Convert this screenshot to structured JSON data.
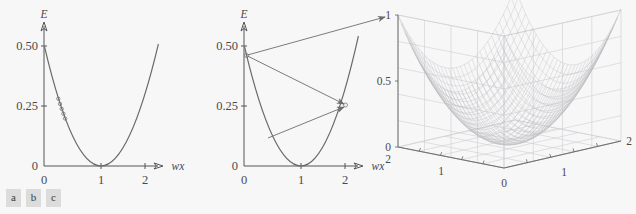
{
  "figure": {
    "background_color": "#f7f7f8",
    "curve_color": "#6a6a6a",
    "mesh_color": "#b9b9bd",
    "grid_color": "#cfcfd2",
    "axis_color": "#555555"
  },
  "caption": {
    "tags": [
      "a",
      "b",
      "c"
    ]
  },
  "panel_a": {
    "name": "error-curve-with-samples",
    "y_axis_label": "E",
    "x_axis_label": "wx",
    "y_ticks": [
      "0.50",
      "0.25",
      "0"
    ],
    "x_ticks": [
      "0",
      "1",
      "2"
    ]
  },
  "panel_b": {
    "name": "error-curve-with-gradient-arrows",
    "y_axis_label": "E",
    "x_axis_label": "wx",
    "y_ticks": [
      "0.50",
      "0.25",
      "0"
    ],
    "x_ticks": [
      "0",
      "1",
      "2"
    ]
  },
  "panel_c": {
    "name": "error-surface-3d",
    "z_ticks": [
      "1",
      "0.5",
      "0"
    ],
    "x_ticks": [
      "0",
      "1",
      "2"
    ],
    "y_ticks": [
      "2",
      "1",
      "0"
    ]
  },
  "chart_data": [
    {
      "type": "line",
      "title": "",
      "panel": "a",
      "xlabel": "wx",
      "ylabel": "E",
      "xlim": [
        -0.12,
        2.25
      ],
      "ylim": [
        0,
        0.56
      ],
      "xticks": [
        0,
        1,
        2
      ],
      "xticklabels": [
        "0",
        "1",
        "2"
      ],
      "yticks": [
        0,
        0.25,
        0.5
      ],
      "yticklabels": [
        "0",
        "0.25",
        "0.50"
      ],
      "grid": false,
      "legend": "none",
      "series": [
        {
          "name": "E = 0.5 (wx - 1)^2",
          "type": "line",
          "x": [
            0.0,
            0.1,
            0.2,
            0.3,
            0.4,
            0.5,
            0.6,
            0.7,
            0.8,
            0.9,
            1.0,
            1.1,
            1.2,
            1.3,
            1.4,
            1.5,
            1.6,
            1.7,
            1.8,
            1.9,
            2.0,
            2.1,
            2.2
          ],
          "y": [
            0.5,
            0.405,
            0.32,
            0.245,
            0.18,
            0.125,
            0.08,
            0.045,
            0.02,
            0.005,
            0.0,
            0.005,
            0.02,
            0.045,
            0.08,
            0.125,
            0.18,
            0.245,
            0.32,
            0.405,
            0.5,
            0.605,
            0.72
          ]
        },
        {
          "name": "sample markers",
          "type": "scatter",
          "x": [
            0.25,
            0.28,
            0.31,
            0.34,
            0.37
          ],
          "y": [
            0.281,
            0.259,
            0.238,
            0.218,
            0.198
          ]
        }
      ]
    },
    {
      "type": "line",
      "title": "",
      "panel": "b",
      "xlabel": "wx",
      "ylabel": "E",
      "xlim": [
        -0.12,
        2.25
      ],
      "ylim": [
        0,
        0.56
      ],
      "xticks": [
        0,
        1,
        2
      ],
      "xticklabels": [
        "0",
        "1",
        "2"
      ],
      "yticks": [
        0,
        0.25,
        0.5
      ],
      "yticklabels": [
        "0",
        "0.25",
        "0.50"
      ],
      "grid": false,
      "legend": "none",
      "series": [
        {
          "name": "E = 0.5 (wx - 1)^2",
          "type": "line",
          "x": [
            0.0,
            0.1,
            0.2,
            0.3,
            0.4,
            0.5,
            0.6,
            0.7,
            0.8,
            0.9,
            1.0,
            1.1,
            1.2,
            1.3,
            1.4,
            1.5,
            1.6,
            1.7,
            1.8,
            1.9,
            2.0,
            2.1,
            2.2
          ],
          "y": [
            0.5,
            0.405,
            0.32,
            0.245,
            0.18,
            0.125,
            0.08,
            0.045,
            0.02,
            0.005,
            0.0,
            0.005,
            0.02,
            0.045,
            0.08,
            0.125,
            0.18,
            0.245,
            0.32,
            0.405,
            0.5,
            0.605,
            0.72
          ]
        }
      ],
      "annotations": [
        {
          "kind": "arrow",
          "label": "tangent-arrow-up-right",
          "from": [
            0.05,
            0.45
          ],
          "to": [
            2.25,
            0.86
          ]
        },
        {
          "kind": "arrow",
          "label": "arrow-to-right-branch",
          "from": [
            0.05,
            0.45
          ],
          "to": [
            1.8,
            0.26
          ]
        },
        {
          "kind": "arrow",
          "label": "arrow-from-left-branch",
          "from": [
            0.52,
            0.12
          ],
          "to": [
            1.8,
            0.255
          ]
        }
      ]
    },
    {
      "type": "surface",
      "panel": "c",
      "title": "",
      "xlabel": "",
      "ylabel": "",
      "zlabel": "",
      "xlim": [
        0,
        2
      ],
      "ylim": [
        0,
        2
      ],
      "zlim": [
        0,
        1
      ],
      "xticks": [
        0,
        1,
        2
      ],
      "xticklabels": [
        "0",
        "1",
        "2"
      ],
      "yticks": [
        0,
        1,
        2
      ],
      "yticklabels": [
        "0",
        "1",
        "2"
      ],
      "zticks": [
        0,
        0.5,
        1
      ],
      "zticklabels": [
        "0",
        "0.5",
        "1"
      ],
      "grid": true,
      "legend": "none",
      "surface_function": "z = 0.5*((x-1)^2 + (y-1)^2)",
      "mesh_resolution": [
        30,
        30
      ]
    }
  ]
}
